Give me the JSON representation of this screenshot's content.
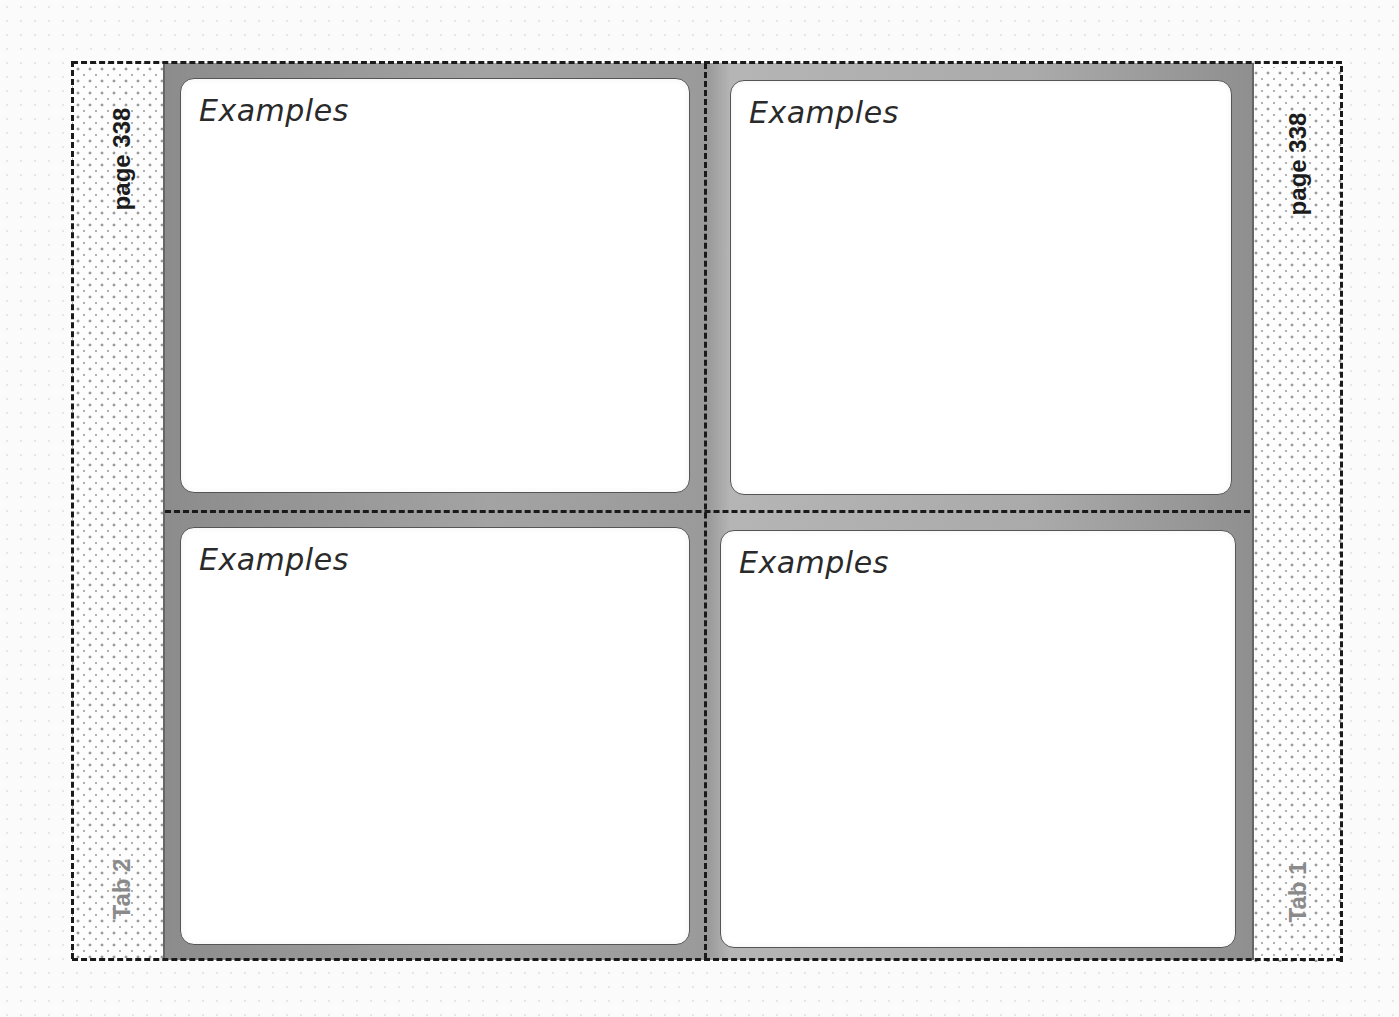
{
  "left_tab": {
    "page_label": "page 338",
    "tab_label": "Tab 2"
  },
  "right_tab": {
    "page_label": "page 338",
    "tab_label": "Tab 1"
  },
  "panels": [
    {
      "position": "top-left",
      "title": "Examples"
    },
    {
      "position": "top-right",
      "title": "Examples"
    },
    {
      "position": "bottom-left",
      "title": "Examples"
    },
    {
      "position": "bottom-right",
      "title": "Examples"
    }
  ],
  "colors": {
    "frame_gray": "#9a9a9a",
    "panel_fill": "#ffffff",
    "cut_line": "#1a1a1a",
    "tab_label_gray": "#8a8a8a"
  }
}
